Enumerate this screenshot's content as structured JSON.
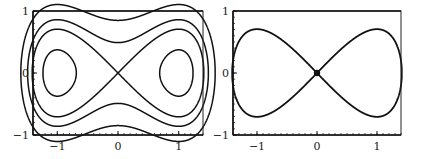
{
  "chart_data": [
    {
      "type": "line",
      "title": "",
      "xlabel": "",
      "ylabel": "",
      "xlim": [
        -1.4,
        1.4
      ],
      "ylim": [
        -1,
        1
      ],
      "xticks": [
        "-1",
        "0",
        "1"
      ],
      "yticks": [
        "-1",
        "0",
        "1"
      ],
      "grid": false,
      "description": "Phase portrait of Duffing-type oscillator: level curves of H = y^2/2 - x^2/2 + x^4/4",
      "series": [
        {
          "name": "inner orbit left",
          "energy": -0.18
        },
        {
          "name": "inner orbit right",
          "energy": -0.18
        },
        {
          "name": "separatrix",
          "energy": 0.0
        },
        {
          "name": "outer orbit 1",
          "energy": 0.12
        },
        {
          "name": "outer orbit 2",
          "energy": 0.36
        }
      ]
    },
    {
      "type": "line",
      "title": "",
      "xlabel": "",
      "ylabel": "",
      "xlim": [
        -1.4,
        1.4
      ],
      "ylim": [
        -1,
        1
      ],
      "xticks": [
        "-1",
        "0",
        "1"
      ],
      "yticks": [
        "-1",
        "0",
        "1"
      ],
      "grid": false,
      "description": "Numerical trajectory tracing the figure-eight separatrix, dense near origin",
      "series": [
        {
          "name": "separatrix trajectory",
          "energy": 0.0
        }
      ]
    }
  ],
  "panels": [
    {
      "x0": 33,
      "y0": 11,
      "x1": 203,
      "y1": 135
    },
    {
      "x0": 233,
      "y0": 11,
      "x1": 401,
      "y1": 135
    }
  ]
}
